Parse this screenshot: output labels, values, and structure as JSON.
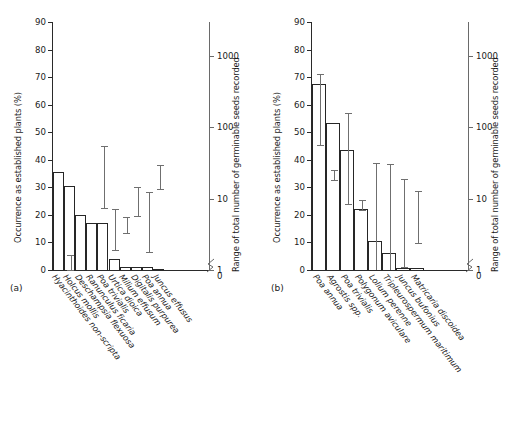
{
  "figure": {
    "axis_titles": {
      "left": "Occurrence as established plants (%)",
      "right": "Range of total number of germinable seeds recorded"
    },
    "panel_tags": {
      "a": "(a)",
      "b": "(b)"
    },
    "left_ticks": [
      "0",
      "10",
      "20",
      "30",
      "40",
      "50",
      "60",
      "70",
      "80",
      "90"
    ],
    "right_ticks": [
      "1",
      "10",
      "100",
      "1000"
    ],
    "break_low_label": "0"
  },
  "chart_data": [
    {
      "type": "bar",
      "panel": "(a)",
      "title": "",
      "xlabel": "",
      "ylabel": "Occurrence as established plants (%)",
      "ylabel_secondary": "Range of total number of germinable seeds recorded",
      "ylim": [
        0,
        90
      ],
      "ytick_values": [
        0,
        10,
        20,
        30,
        40,
        50,
        60,
        70,
        80,
        90
      ],
      "y2_scale": "log",
      "y2lim": [
        1,
        3000
      ],
      "y2tick_values": [
        1,
        10,
        100,
        1000
      ],
      "grid": false,
      "legend": "none",
      "categories": [
        "Hyacinthoides non-scripta",
        "Holcus mollis",
        "Deschampsia flexuosa",
        "Ranunculus ficaria",
        "Poa trivialis",
        "Urtica dioica",
        "Milium effusum",
        "Digitalis purpurea",
        "Poa annua",
        "Juncus effusus"
      ],
      "series": [
        {
          "name": "Occurrence as established plants (%)",
          "axis": "left",
          "values": [
            35.5,
            30.5,
            20.0,
            17.0,
            17.0,
            4.0,
            1.2,
            1.2,
            1.2,
            0.0
          ]
        },
        {
          "name": "Range of total number of germinable seeds recorded",
          "axis": "right",
          "ranges": [
            null,
            [
              1.0,
              1.6
            ],
            null,
            null,
            [
              7.5,
              55.0
            ],
            [
              1.9,
              7.2
            ],
            [
              3.3,
              5.6
            ],
            [
              5.8,
              14.5
            ],
            [
              1.8,
              12.6
            ],
            [
              13.5,
              30.0
            ]
          ]
        }
      ]
    },
    {
      "type": "bar",
      "panel": "(b)",
      "title": "",
      "xlabel": "",
      "ylabel": "Occurrence as established plants (%)",
      "ylabel_secondary": "Range of total number of germinable seeds recorded",
      "ylim": [
        0,
        90
      ],
      "ytick_values": [
        0,
        10,
        20,
        30,
        40,
        50,
        60,
        70,
        80,
        90
      ],
      "y2_scale": "log",
      "y2lim": [
        1,
        3000
      ],
      "y2tick_values": [
        1,
        10,
        100,
        1000
      ],
      "grid": false,
      "legend": "none",
      "categories": [
        "Poa annua",
        "Agrostis spp.",
        "Poa trivialis",
        "Polygonum aviculare",
        "Lolium perenne",
        "Tripleurospermum maritimum",
        "Juncus bufonius",
        "Matricaria discoidea"
      ],
      "series": [
        {
          "name": "Occurrence as established plants (%)",
          "axis": "left",
          "values": [
            67.5,
            53.5,
            43.5,
            22.0,
            10.5,
            6.3,
            0.7,
            0.7
          ]
        },
        {
          "name": "Range of total number of germinable seeds recorded",
          "axis": "right",
          "ranges": [
            [
              56.0,
              560.0
            ],
            [
              18.0,
              25.0
            ],
            [
              8.5,
              160.0
            ],
            [
              7.0,
              9.5
            ],
            [
              null,
              32.0
            ],
            [
              null,
              31.0
            ],
            [
              1.1,
              19.0
            ],
            [
              2.4,
              13.0
            ]
          ]
        }
      ]
    }
  ]
}
